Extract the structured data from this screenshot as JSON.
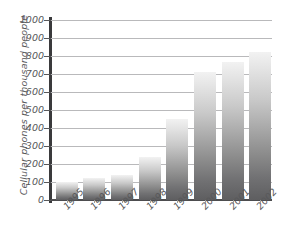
{
  "chart_data": {
    "type": "bar",
    "title": "",
    "xlabel": "",
    "ylabel": "Cellular phones per thousand people",
    "categories": [
      "1995",
      "1996",
      "1997",
      "1998",
      "1999",
      "2000",
      "2001",
      "2002"
    ],
    "values": [
      100,
      120,
      140,
      240,
      450,
      710,
      765,
      825
    ],
    "ylim": [
      0,
      1000
    ],
    "ytick_values": [
      0,
      100,
      200,
      300,
      400,
      500,
      600,
      700,
      800,
      900,
      1000
    ],
    "ytick_labels": [
      "0",
      "100",
      "200",
      "300",
      "400",
      "500",
      "600",
      "700",
      "800",
      "900",
      "1000"
    ],
    "grid": true,
    "legend": false,
    "legend_position": "none",
    "series": [
      {
        "name": "Cellular phones per thousand people",
        "values": [
          100,
          120,
          140,
          240,
          450,
          710,
          765,
          825
        ]
      }
    ],
    "bar_fill": "vertical-gradient-light-to-dark-gray",
    "colors": {
      "bar_top": "#f2f2f2",
      "bar_bottom": "#5e5e60",
      "gridline": "#b9b9bb",
      "axis": "#3a3a3c",
      "text": "#58585a",
      "background": "#ffffff"
    }
  }
}
